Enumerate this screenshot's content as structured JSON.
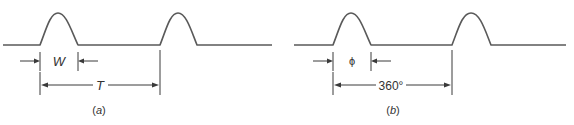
{
  "figure": {
    "panels": [
      {
        "id": "a",
        "caption": "(a)",
        "caption_letter": "a",
        "width_label": "W",
        "period_label": "T",
        "pulse_count": 2
      },
      {
        "id": "b",
        "caption": "(b)",
        "caption_letter": "b",
        "width_label": "ϕ",
        "period_label": "360°",
        "pulse_count": 2
      }
    ],
    "colors": {
      "waveform": "#5a5a5a",
      "dimension_lines": "#3a3a3a",
      "text": "#333333",
      "background": "#ffffff"
    }
  }
}
